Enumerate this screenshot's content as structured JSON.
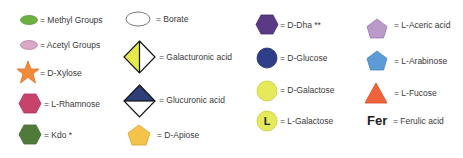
{
  "legend": {
    "column1": [
      {
        "symbol": "green-ellipse",
        "label": "= Methyl Groups",
        "color": "#6fb043"
      },
      {
        "symbol": "pink-ellipse",
        "label": "= Acetyl Groups",
        "color": "#d9a8c4"
      },
      {
        "symbol": "orange-star",
        "label": "= D-Xylose",
        "color": "#f28a3c"
      },
      {
        "symbol": "crimson-hexagon",
        "label": "= L-Rhamnose",
        "color": "#c8436b"
      },
      {
        "symbol": "green-hexagon",
        "label": "= Kdo *",
        "color": "#4f7a3a"
      }
    ],
    "column2": [
      {
        "symbol": "white-ellipse",
        "label": "= Borate",
        "color": "#ffffff"
      },
      {
        "symbol": "half-yellow-diamond",
        "label": "= Galacturonic acid",
        "color": "#e6ea4a"
      },
      {
        "symbol": "half-navy-diamond",
        "label": "= Glucuronic acid",
        "color": "#2e3e78"
      },
      {
        "symbol": "yellow-pentagon",
        "label": "= D-Apiose",
        "color": "#f5c24a"
      }
    ],
    "column3": [
      {
        "symbol": "purple-hexagon",
        "label": "= D-Dha **",
        "color": "#5a3a84"
      },
      {
        "symbol": "navy-circle",
        "label": "= D-Glucose",
        "color": "#2e3e88"
      },
      {
        "symbol": "yellow-circle",
        "label": "= D-Galactose",
        "color": "#e6ea5a"
      },
      {
        "symbol": "yellow-circle-L",
        "label": "= L-Galactose",
        "color": "#e6ea5a",
        "letter": "L"
      }
    ],
    "column4": [
      {
        "symbol": "lilac-pentagon",
        "label": "= L-Aceric acid",
        "color": "#b99ac8"
      },
      {
        "symbol": "blue-pentagon",
        "label": "= L-Arabinose",
        "color": "#5b9bd8"
      },
      {
        "symbol": "red-orange-triangle",
        "label": "= L-Fucose",
        "color": "#f0643a"
      },
      {
        "symbol": "fer-text",
        "abbr": "Fer",
        "label": "= Ferulic acid"
      }
    ]
  }
}
